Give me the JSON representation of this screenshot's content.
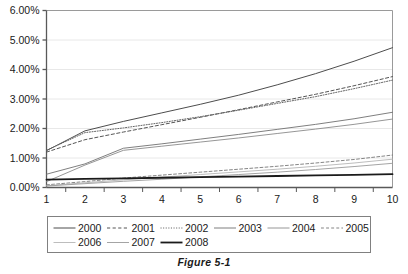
{
  "figure": {
    "caption": "Figure 5-1"
  },
  "chart_data": {
    "type": "line",
    "title": "",
    "xlabel": "",
    "ylabel": "",
    "x": [
      1,
      2,
      3,
      4,
      5,
      6,
      7,
      8,
      9,
      10
    ],
    "xlim": [
      1,
      10
    ],
    "ylim": [
      0,
      6
    ],
    "yticks": [
      0,
      1,
      2,
      3,
      4,
      5,
      6
    ],
    "ytick_labels": [
      "0.00%",
      "1.00%",
      "2.00%",
      "3.00%",
      "4.00%",
      "5.00%",
      "6.00%"
    ],
    "xtick_labels": [
      "1",
      "2",
      "3",
      "4",
      "5",
      "6",
      "7",
      "8",
      "9",
      "10"
    ],
    "grid": true,
    "legend_position": "bottom",
    "unit": "percent",
    "series": [
      {
        "name": "2000",
        "style": "solid",
        "color": "#4d4d4d",
        "width": 1.0,
        "values": [
          1.25,
          1.92,
          2.24,
          2.53,
          2.82,
          3.13,
          3.48,
          3.86,
          4.28,
          4.74
        ]
      },
      {
        "name": "2001",
        "style": "dashed",
        "color": "#555555",
        "width": 1.0,
        "values": [
          1.2,
          1.62,
          1.88,
          2.13,
          2.38,
          2.64,
          2.9,
          3.16,
          3.45,
          3.76
        ]
      },
      {
        "name": "2002",
        "style": "dotted",
        "color": "#666666",
        "width": 1.0,
        "values": [
          1.26,
          1.86,
          2.02,
          2.2,
          2.4,
          2.62,
          2.85,
          3.08,
          3.35,
          3.64
        ]
      },
      {
        "name": "2003",
        "style": "solid",
        "color": "#707070",
        "width": 0.9,
        "values": [
          0.45,
          0.8,
          1.33,
          1.48,
          1.64,
          1.8,
          1.97,
          2.14,
          2.33,
          2.55
        ]
      },
      {
        "name": "2004",
        "style": "solid",
        "color": "#8a8a8a",
        "width": 0.9,
        "values": [
          0.2,
          0.76,
          1.26,
          1.4,
          1.54,
          1.68,
          1.83,
          1.98,
          2.14,
          2.32
        ]
      },
      {
        "name": "2005",
        "style": "dashed",
        "color": "#777777",
        "width": 0.9,
        "values": [
          0.09,
          0.2,
          0.32,
          0.42,
          0.52,
          0.62,
          0.72,
          0.83,
          0.95,
          1.1
        ]
      },
      {
        "name": "2006",
        "style": "solid",
        "color": "#b5b5b5",
        "width": 0.9,
        "values": [
          0.06,
          0.16,
          0.26,
          0.35,
          0.44,
          0.53,
          0.62,
          0.72,
          0.83,
          0.96
        ]
      },
      {
        "name": "2007",
        "style": "solid",
        "color": "#9a9a9a",
        "width": 0.9,
        "values": [
          0.05,
          0.13,
          0.21,
          0.28,
          0.36,
          0.44,
          0.52,
          0.61,
          0.71,
          0.82
        ]
      },
      {
        "name": "2008",
        "style": "solid-thick",
        "color": "#1a1a1a",
        "width": 1.8,
        "values": [
          0.27,
          0.29,
          0.31,
          0.33,
          0.35,
          0.37,
          0.39,
          0.41,
          0.43,
          0.45
        ]
      }
    ]
  },
  "legend": {
    "rows": [
      [
        "2000",
        "2001",
        "2002",
        "2003",
        "2004",
        "2005"
      ],
      [
        "2006",
        "2007",
        "2008"
      ]
    ]
  },
  "colors": {
    "axis": "#595959",
    "grid": "#e8e8e8",
    "text": "#1a1a1a",
    "legend_border": "#808080"
  }
}
